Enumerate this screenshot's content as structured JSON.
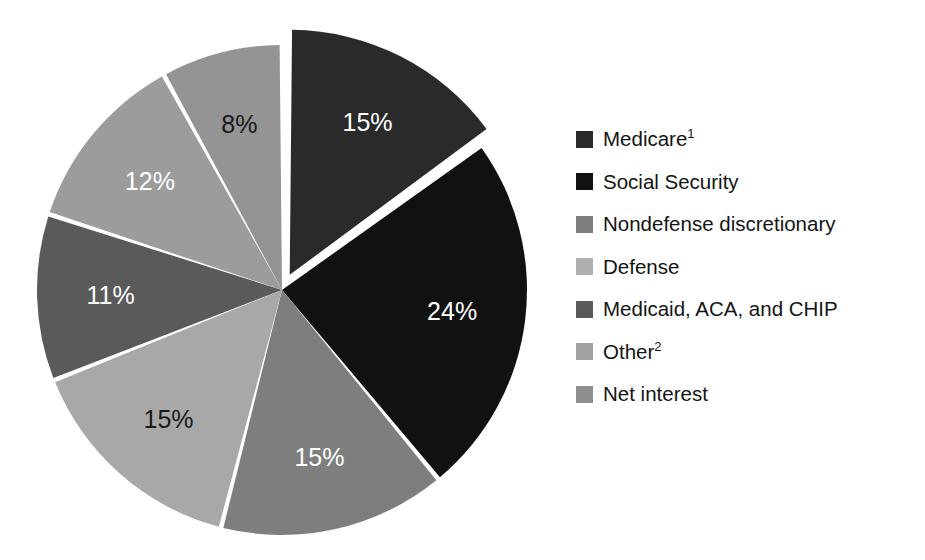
{
  "chart_data": {
    "type": "pie",
    "title": "",
    "subtitle": "",
    "xlabel": "",
    "ylabel": "",
    "legend_position": "right",
    "grid": false,
    "explode_index": 0,
    "start_angle_deg": 0,
    "direction": "clockwise",
    "units": "percent",
    "categories": [
      "Medicare",
      "Social Security",
      "Nondefense discretionary",
      "Defense",
      "Medicaid, ACA, and CHIP",
      "Other",
      "Net interest"
    ],
    "values": [
      15,
      24,
      15,
      15,
      11,
      12,
      8
    ],
    "data_labels": [
      "15%",
      "24%",
      "15%",
      "15%",
      "11%",
      "12%",
      "8%"
    ],
    "colors": [
      "#2a2a2a",
      "#111111",
      "#7e7e7e",
      "#a8a8a8",
      "#5a5a5a",
      "#9c9c9c",
      "#949494"
    ],
    "label_text_colors": [
      "#ffffff",
      "#ffffff",
      "#ffffff",
      "#1a1a1a",
      "#ffffff",
      "#ffffff",
      "#1a1a1a"
    ],
    "slices": [
      {
        "name": "Medicare",
        "label": "Medicare",
        "footnote": "1",
        "value": 15,
        "data_label": "15%",
        "color": "#2a2a2a",
        "label_color": "#ffffff",
        "exploded": true
      },
      {
        "name": "Social Security",
        "label": "Social Security",
        "footnote": "",
        "value": 24,
        "data_label": "24%",
        "color": "#111111",
        "label_color": "#ffffff",
        "exploded": false
      },
      {
        "name": "Nondefense discretionary",
        "label": "Nondefense discretionary",
        "footnote": "",
        "value": 15,
        "data_label": "15%",
        "color": "#7e7e7e",
        "label_color": "#ffffff",
        "exploded": false
      },
      {
        "name": "Defense",
        "label": "Defense",
        "footnote": "",
        "value": 15,
        "data_label": "15%",
        "color": "#a8a8a8",
        "label_color": "#1a1a1a",
        "exploded": false
      },
      {
        "name": "Medicaid, ACA, and CHIP",
        "label": "Medicaid, ACA, and CHIP",
        "footnote": "",
        "value": 11,
        "data_label": "11%",
        "color": "#5a5a5a",
        "label_color": "#ffffff",
        "exploded": false
      },
      {
        "name": "Other",
        "label": "Other",
        "footnote": "2",
        "value": 12,
        "data_label": "12%",
        "color": "#9c9c9c",
        "label_color": "#ffffff",
        "exploded": false
      },
      {
        "name": "Net interest",
        "label": "Net interest",
        "footnote": "",
        "value": 8,
        "data_label": "8%",
        "color": "#949494",
        "label_color": "#1a1a1a",
        "exploded": false
      }
    ]
  },
  "legend": {
    "items": [
      {
        "label": "Medicare",
        "footnote": "1",
        "color": "#2a2a2a"
      },
      {
        "label": "Social Security",
        "footnote": "",
        "color": "#111111"
      },
      {
        "label": "Nondefense discretionary",
        "footnote": "",
        "color": "#7e7e7e"
      },
      {
        "label": "Defense",
        "footnote": "",
        "color": "#b0b0b0"
      },
      {
        "label": "Medicaid, ACA, and CHIP",
        "footnote": "",
        "color": "#5a5a5a"
      },
      {
        "label": "Other",
        "footnote": "2",
        "color": "#a2a2a2"
      },
      {
        "label": "Net interest",
        "footnote": "",
        "color": "#8e8e8e"
      }
    ]
  },
  "geometry": {
    "center_x": 282,
    "center_y": 290,
    "radius": 245,
    "explode_offset": 17,
    "gap_degrees": 1.1,
    "label_radius_ratio": 0.7
  }
}
